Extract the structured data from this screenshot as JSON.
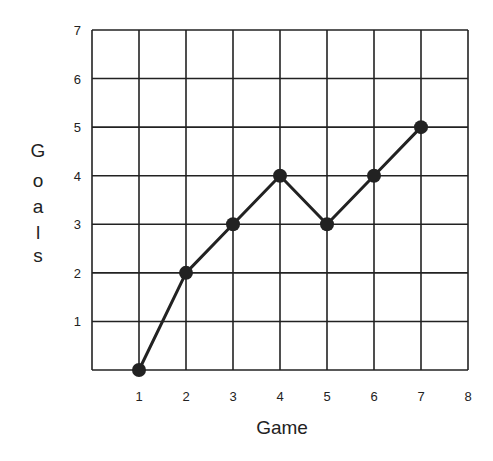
{
  "chart_data": {
    "type": "line",
    "title": "",
    "xlabel": "Game",
    "ylabel": "Goals",
    "x": [
      1,
      2,
      3,
      4,
      5,
      6,
      7
    ],
    "series": [
      {
        "name": "Goals",
        "values": [
          0,
          2,
          3,
          4,
          3,
          4,
          5
        ]
      }
    ],
    "xticks": [
      "1",
      "2",
      "3",
      "4",
      "5",
      "6",
      "7",
      "8"
    ],
    "yticks": [
      "1",
      "2",
      "3",
      "4",
      "5",
      "6",
      "7"
    ],
    "xlim": [
      0,
      8
    ],
    "ylim": [
      0,
      7
    ],
    "grid": true,
    "legend": null,
    "colors": {
      "line": "#222222",
      "marker": "#222222",
      "grid": "#222222"
    }
  },
  "labels": {
    "xlabel": "Game",
    "ylabel_letters": [
      "G",
      "o",
      "a",
      "l",
      "s"
    ]
  }
}
